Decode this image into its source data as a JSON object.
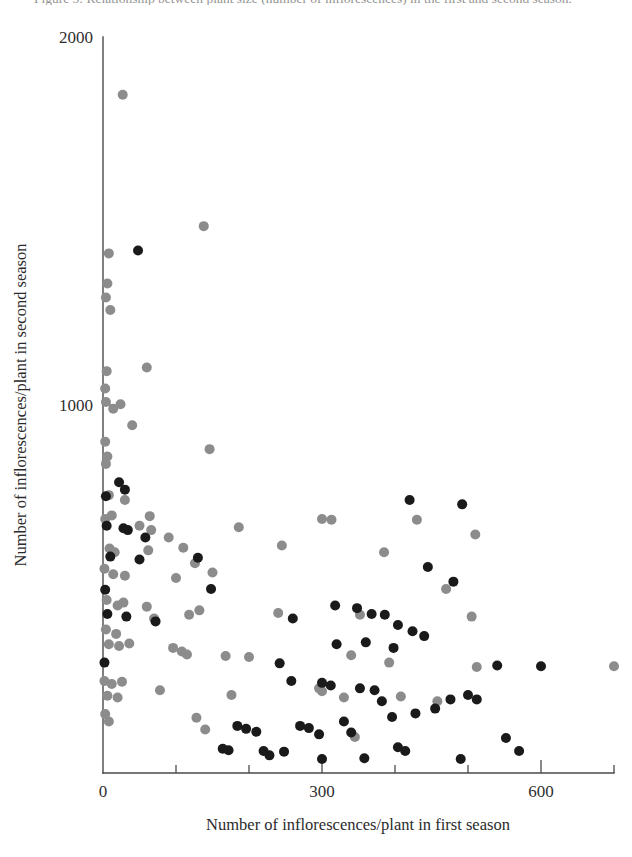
{
  "figure": {
    "caption_sliver": "Figure 3: Relationship between plant size (number of inflorescences) in the first and second season.",
    "background_color": "#ffffff"
  },
  "chart_data": {
    "type": "scatter",
    "title": "",
    "subtitle": "",
    "xlabel": "Number of inflorescences/plant in first season",
    "ylabel": "Number of inflorescences/plant in second season",
    "xlim": [
      0,
      700
    ],
    "ylim": [
      0,
      2000
    ],
    "x_ticks_major": [
      0,
      300,
      600
    ],
    "x_tick_labels": [
      "0",
      "300",
      "600"
    ],
    "x_ticks_minor": [
      100,
      200,
      400,
      500,
      700
    ],
    "y_ticks_major": [
      1000,
      2000
    ],
    "y_tick_labels": [
      "1000",
      "2000"
    ],
    "y_ticks_minor": [],
    "grid": false,
    "legend_position": "none",
    "marker_radius_px": 5,
    "series": [
      {
        "name": "grey",
        "color": "#8c8c8c",
        "marker": "filled-circle",
        "points": [
          [
            27,
            1843
          ],
          [
            138,
            1486
          ],
          [
            8,
            1412
          ],
          [
            6,
            1330
          ],
          [
            4,
            1292
          ],
          [
            10,
            1258
          ],
          [
            5,
            1092
          ],
          [
            3,
            1045
          ],
          [
            4,
            1008
          ],
          [
            24,
            1002
          ],
          [
            14,
            990
          ],
          [
            60,
            1102
          ],
          [
            40,
            945
          ],
          [
            146,
            880
          ],
          [
            3,
            900
          ],
          [
            6,
            860
          ],
          [
            4,
            840
          ],
          [
            8,
            755
          ],
          [
            30,
            742
          ],
          [
            12,
            700
          ],
          [
            64,
            698
          ],
          [
            3,
            690
          ],
          [
            50,
            672
          ],
          [
            66,
            660
          ],
          [
            300,
            690
          ],
          [
            313,
            688
          ],
          [
            430,
            688
          ],
          [
            510,
            648
          ],
          [
            186,
            668
          ],
          [
            9,
            610
          ],
          [
            16,
            600
          ],
          [
            90,
            640
          ],
          [
            110,
            612
          ],
          [
            62,
            605
          ],
          [
            245,
            618
          ],
          [
            385,
            600
          ],
          [
            126,
            570
          ],
          [
            2,
            555
          ],
          [
            14,
            540
          ],
          [
            30,
            536
          ],
          [
            150,
            545
          ],
          [
            100,
            530
          ],
          [
            5,
            470
          ],
          [
            28,
            463
          ],
          [
            20,
            455
          ],
          [
            60,
            452
          ],
          [
            132,
            442
          ],
          [
            70,
            420
          ],
          [
            118,
            430
          ],
          [
            240,
            435
          ],
          [
            352,
            430
          ],
          [
            505,
            425
          ],
          [
            470,
            500
          ],
          [
            4,
            390
          ],
          [
            18,
            378
          ],
          [
            8,
            350
          ],
          [
            22,
            345
          ],
          [
            36,
            352
          ],
          [
            96,
            340
          ],
          [
            108,
            330
          ],
          [
            115,
            322
          ],
          [
            168,
            318
          ],
          [
            200,
            315
          ],
          [
            340,
            320
          ],
          [
            392,
            300
          ],
          [
            700,
            290
          ],
          [
            512,
            288
          ],
          [
            2,
            250
          ],
          [
            12,
            242
          ],
          [
            26,
            248
          ],
          [
            6,
            210
          ],
          [
            20,
            205
          ],
          [
            78,
            225
          ],
          [
            176,
            212
          ],
          [
            296,
            230
          ],
          [
            300,
            222
          ],
          [
            330,
            205
          ],
          [
            408,
            208
          ],
          [
            458,
            195
          ],
          [
            3,
            160
          ],
          [
            8,
            140
          ],
          [
            128,
            150
          ],
          [
            140,
            118
          ],
          [
            345,
            98
          ]
        ]
      },
      {
        "name": "black",
        "color": "#1a1a1a",
        "marker": "filled-circle",
        "points": [
          [
            48,
            1420
          ],
          [
            22,
            790
          ],
          [
            30,
            770
          ],
          [
            4,
            752
          ],
          [
            420,
            742
          ],
          [
            492,
            730
          ],
          [
            5,
            672
          ],
          [
            28,
            665
          ],
          [
            34,
            660
          ],
          [
            58,
            640
          ],
          [
            10,
            588
          ],
          [
            50,
            580
          ],
          [
            130,
            585
          ],
          [
            148,
            500
          ],
          [
            3,
            498
          ],
          [
            445,
            560
          ],
          [
            480,
            520
          ],
          [
            6,
            432
          ],
          [
            32,
            425
          ],
          [
            72,
            412
          ],
          [
            260,
            420
          ],
          [
            318,
            455
          ],
          [
            348,
            448
          ],
          [
            368,
            432
          ],
          [
            386,
            430
          ],
          [
            404,
            402
          ],
          [
            424,
            385
          ],
          [
            440,
            372
          ],
          [
            320,
            350
          ],
          [
            360,
            355
          ],
          [
            398,
            340
          ],
          [
            2,
            300
          ],
          [
            242,
            298
          ],
          [
            540,
            292
          ],
          [
            600,
            290
          ],
          [
            258,
            250
          ],
          [
            300,
            245
          ],
          [
            312,
            238
          ],
          [
            352,
            230
          ],
          [
            372,
            225
          ],
          [
            382,
            195
          ],
          [
            476,
            200
          ],
          [
            500,
            212
          ],
          [
            512,
            200
          ],
          [
            455,
            175
          ],
          [
            428,
            162
          ],
          [
            396,
            152
          ],
          [
            184,
            128
          ],
          [
            196,
            120
          ],
          [
            210,
            112
          ],
          [
            270,
            128
          ],
          [
            282,
            122
          ],
          [
            296,
            105
          ],
          [
            330,
            140
          ],
          [
            340,
            110
          ],
          [
            164,
            66
          ],
          [
            172,
            62
          ],
          [
            220,
            60
          ],
          [
            228,
            48
          ],
          [
            248,
            58
          ],
          [
            300,
            38
          ],
          [
            358,
            40
          ],
          [
            404,
            70
          ],
          [
            414,
            60
          ],
          [
            490,
            38
          ],
          [
            552,
            95
          ],
          [
            570,
            60
          ]
        ]
      }
    ]
  },
  "geometry": {
    "plot_left_px": 103,
    "plot_right_px": 614,
    "plot_top_px": 37,
    "plot_bottom_px": 773
  }
}
